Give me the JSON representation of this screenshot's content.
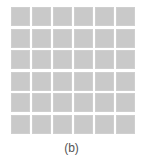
{
  "figure": {
    "label": "(b)",
    "grid": {
      "rows": 6,
      "columns": 6,
      "cell_color": "#c9c9c9"
    }
  }
}
